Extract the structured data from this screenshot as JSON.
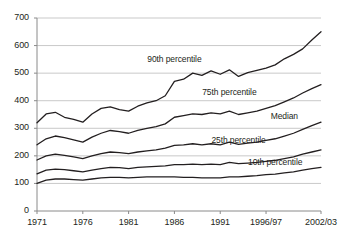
{
  "chart_data": {
    "type": "line",
    "title": "",
    "subtitle": "",
    "xlabel": "",
    "ylabel": "",
    "grid": true,
    "legend_position": "inline-labels",
    "ylim": [
      0,
      700
    ],
    "yticks": [
      0,
      100,
      200,
      300,
      400,
      500,
      600,
      700
    ],
    "ytick_labels": [
      "0",
      "100",
      "200",
      "300",
      "400",
      "500",
      "600",
      "700"
    ],
    "xticks": [
      1971,
      1976,
      1981,
      1986,
      1991,
      1996,
      2002
    ],
    "xtick_labels": [
      "1971",
      "1976",
      "1981",
      "1986",
      "1991",
      "1996/97",
      "2002/03"
    ],
    "x": [
      1971,
      1972,
      1973,
      1974,
      1975,
      1976,
      1977,
      1978,
      1979,
      1980,
      1981,
      1982,
      1983,
      1984,
      1985,
      1986,
      1987,
      1988,
      1989,
      1990,
      1991,
      1992,
      1993,
      1994,
      1995,
      1996,
      1997,
      1998,
      1999,
      2000,
      2001,
      2002
    ],
    "series": [
      {
        "name": "90th percentile",
        "color": "#231f20",
        "values": [
          320,
          352,
          358,
          340,
          332,
          322,
          352,
          372,
          378,
          368,
          362,
          380,
          392,
          400,
          418,
          470,
          478,
          500,
          492,
          508,
          496,
          512,
          488,
          502,
          510,
          518,
          530,
          552,
          568,
          588,
          620,
          650
        ]
      },
      {
        "name": "75th percentile",
        "color": "#231f20",
        "values": [
          240,
          262,
          272,
          266,
          258,
          250,
          268,
          282,
          292,
          288,
          282,
          292,
          300,
          306,
          316,
          340,
          346,
          352,
          350,
          356,
          352,
          362,
          350,
          356,
          362,
          372,
          382,
          396,
          410,
          428,
          444,
          458
        ]
      },
      {
        "name": "Median",
        "color": "#231f20",
        "values": [
          185,
          200,
          206,
          202,
          196,
          190,
          200,
          208,
          214,
          212,
          208,
          214,
          218,
          222,
          228,
          238,
          240,
          244,
          240,
          244,
          240,
          250,
          242,
          246,
          250,
          256,
          262,
          272,
          282,
          296,
          310,
          322
        ]
      },
      {
        "name": "25th percentile",
        "color": "#231f20",
        "values": [
          135,
          148,
          152,
          150,
          146,
          142,
          148,
          154,
          158,
          157,
          154,
          158,
          160,
          162,
          164,
          168,
          168,
          170,
          168,
          170,
          168,
          176,
          172,
          174,
          176,
          180,
          184,
          190,
          196,
          206,
          214,
          222
        ]
      },
      {
        "name": "10th percentile",
        "color": "#231f20",
        "values": [
          100,
          112,
          116,
          116,
          114,
          112,
          116,
          120,
          122,
          122,
          120,
          122,
          124,
          124,
          124,
          124,
          122,
          122,
          120,
          120,
          120,
          124,
          124,
          126,
          128,
          132,
          134,
          138,
          142,
          148,
          154,
          158
        ]
      }
    ],
    "annotations": [
      {
        "text": "90th percentile",
        "x": 1986,
        "y": 530
      },
      {
        "text": "75th percentile",
        "x": 1992,
        "y": 410
      },
      {
        "text": "Median",
        "x": 1998,
        "y": 322
      },
      {
        "text": "25th percentile",
        "x": 1993,
        "y": 236
      },
      {
        "text": "10th percentile",
        "x": 1997,
        "y": 156
      }
    ]
  },
  "axis": {
    "y_ticks": [
      "700",
      "600",
      "500",
      "400",
      "300",
      "200",
      "100",
      "0"
    ],
    "x_ticks": [
      "1971",
      "1976",
      "1981",
      "1986",
      "1991",
      "1996/97",
      "2002/03"
    ]
  },
  "labels": {
    "p90": "90th percentile",
    "p75": "75th percentile",
    "median": "Median",
    "p25": "25th percentile",
    "p10": "10th percentile"
  },
  "colors": {
    "line": "#231f20",
    "grid": "#c9c9c9",
    "axis": "#8a8a8a",
    "text": "#231f20",
    "background": "#ffffff"
  }
}
